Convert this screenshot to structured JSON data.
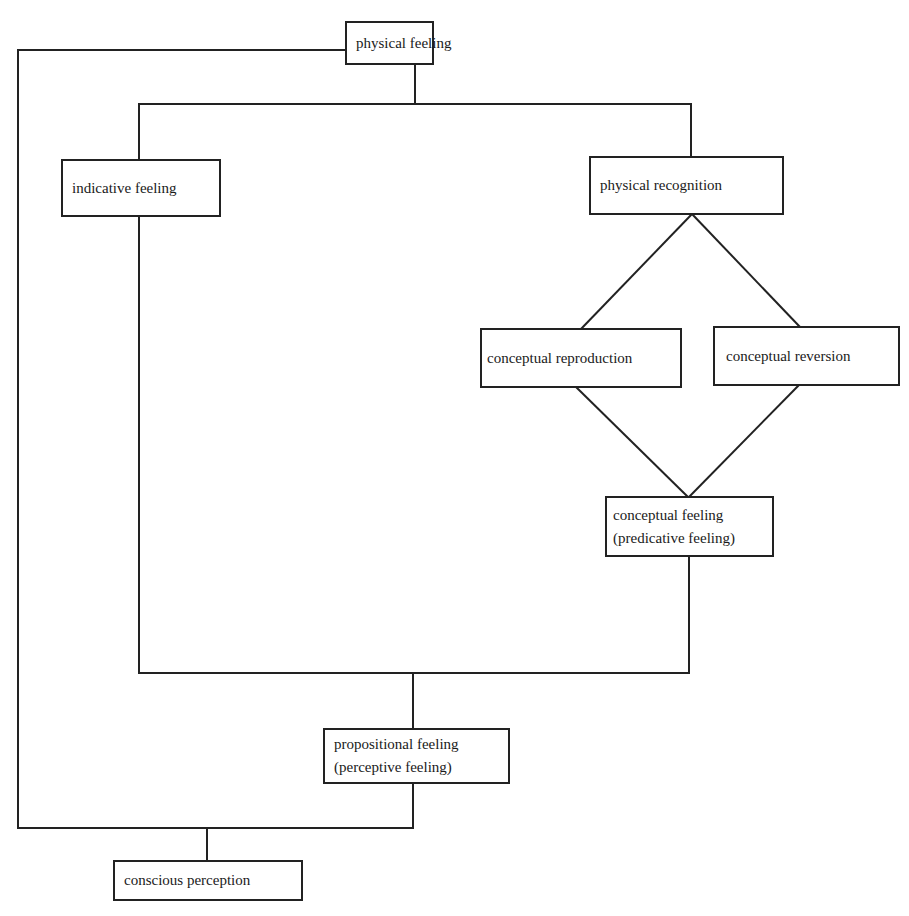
{
  "diagram": {
    "type": "flowchart",
    "nodes": {
      "physical_feeling": {
        "line1": "physical feeling"
      },
      "indicative_feeling": {
        "line1": "indicative feeling"
      },
      "physical_recognition": {
        "line1": "physical recognition"
      },
      "conceptual_reproduction": {
        "line1": "conceptual reproduction"
      },
      "conceptual_reversion": {
        "line1": "conceptual reversion"
      },
      "conceptual_feeling": {
        "line1": "conceptual feeling",
        "line2": "(predicative feeling)"
      },
      "propositional_feeling": {
        "line1": "propositional feeling",
        "line2": "(perceptive feeling)"
      },
      "conscious_perception": {
        "line1": "conscious perception"
      }
    },
    "edges": [
      [
        "physical feeling",
        "indicative feeling"
      ],
      [
        "physical feeling",
        "physical recognition"
      ],
      [
        "physical feeling",
        "conscious perception"
      ],
      [
        "physical recognition",
        "conceptual reproduction"
      ],
      [
        "physical recognition",
        "conceptual reversion"
      ],
      [
        "conceptual reproduction",
        "conceptual feeling"
      ],
      [
        "conceptual reversion",
        "conceptual feeling"
      ],
      [
        "indicative feeling",
        "propositional feeling"
      ],
      [
        "conceptual feeling",
        "propositional feeling"
      ],
      [
        "propositional feeling",
        "conscious perception"
      ]
    ],
    "colors": {
      "line": "#222222",
      "background": "#ffffff"
    }
  }
}
